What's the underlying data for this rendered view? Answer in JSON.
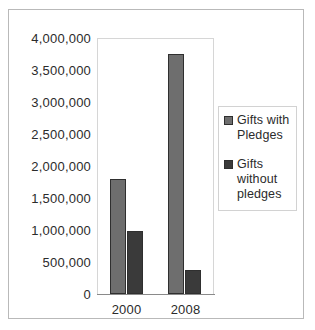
{
  "chart_data": {
    "type": "bar",
    "title": "",
    "xlabel": "",
    "ylabel": "",
    "categories": [
      "2000",
      "2008"
    ],
    "series": [
      {
        "name": "Gifts with Pledges",
        "color": "#6e6e6e",
        "values": [
          1800000,
          3750000
        ]
      },
      {
        "name": "Gifts without pledges",
        "color": "#3a3a3a",
        "values": [
          980000,
          370000
        ]
      }
    ],
    "ylim": [
      0,
      4000000
    ],
    "ytick_step": 500000,
    "ytick_labels": [
      "4,000,000",
      "3,500,000",
      "3,000,000",
      "2,500,000",
      "2,000,000",
      "1,500,000",
      "1,000,000",
      "500,000",
      "0"
    ],
    "ytick_values": [
      4000000,
      3500000,
      3000000,
      2500000,
      2000000,
      1500000,
      1000000,
      500000,
      0
    ],
    "grid": false,
    "legend_position": "right",
    "legend_entries": [
      "Gifts with Pledges",
      "Gifts without pledges"
    ]
  }
}
